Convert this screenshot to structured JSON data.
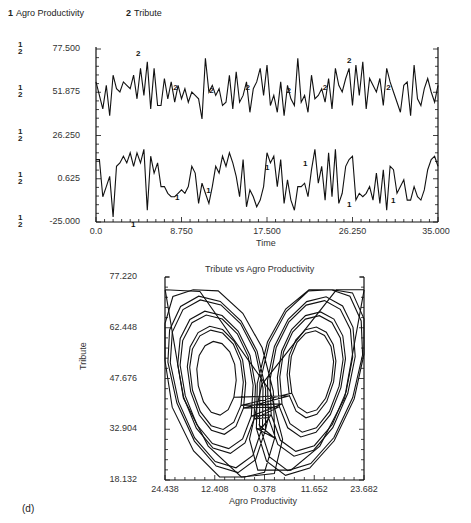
{
  "legend": {
    "items": [
      {
        "num": "1",
        "label": "Agro Productivity"
      },
      {
        "num": "2",
        "label": "Tribute"
      }
    ]
  },
  "panel_label": "(d)",
  "chart_data": [
    {
      "type": "line",
      "title": "",
      "xlabel": "Time",
      "ylabel": "",
      "xlim": [
        0.0,
        35.0
      ],
      "ylim": [
        -25.0,
        77.5
      ],
      "x_ticks": [
        "0.0",
        "8.750",
        "17.500",
        "26.250",
        "35.000"
      ],
      "y_ticks": [
        "77.500",
        "51.875",
        "26.250",
        "0.625",
        "-25.000"
      ],
      "y_tick_markers": "1 2",
      "legend_position": "top-left",
      "grid": false,
      "series": [
        {
          "name": "Agro Productivity",
          "marker": "1",
          "description": "Chaotic oscillation roughly between -20 and 20, centered near 0.6",
          "x": [
            0,
            0.35,
            0.7,
            1.05,
            1.4,
            1.75,
            2.1,
            2.45,
            2.8,
            3.15,
            3.5,
            3.85,
            4.2,
            4.55,
            4.9,
            5.25,
            5.6,
            5.95,
            6.3,
            6.65,
            7.0,
            7.35,
            7.7,
            8.05,
            8.4,
            8.75,
            9.1,
            9.45,
            9.8,
            10.15,
            10.5,
            10.85,
            11.2,
            11.55,
            11.9,
            12.25,
            12.6,
            12.95,
            13.3,
            13.65,
            14.0,
            14.35,
            14.7,
            15.05,
            15.4,
            15.75,
            16.1,
            16.45,
            16.8,
            17.15,
            17.5,
            17.85,
            18.2,
            18.55,
            18.9,
            19.25,
            19.6,
            19.95,
            20.3,
            20.65,
            21.0,
            21.35,
            21.7,
            22.05,
            22.4,
            22.75,
            23.1,
            23.45,
            23.8,
            24.15,
            24.5,
            24.85,
            25.2,
            25.55,
            25.9,
            26.25,
            26.6,
            26.95,
            27.3,
            27.65,
            28.0,
            28.35,
            28.7,
            29.05,
            29.4,
            29.75,
            30.1,
            30.45,
            30.8,
            31.15,
            31.5,
            31.85,
            32.2,
            32.55,
            32.9,
            33.25,
            33.6,
            33.95,
            34.3,
            34.65,
            35.0
          ],
          "values": [
            12,
            12,
            -10,
            -4,
            2,
            -22,
            8,
            10,
            14,
            10,
            16,
            8,
            16,
            10,
            18,
            -18,
            14,
            4,
            10,
            -4,
            -4,
            -8,
            -10,
            -10,
            -8,
            -6,
            -8,
            -4,
            8,
            4,
            -14,
            -2,
            -8,
            -14,
            -4,
            8,
            4,
            14,
            8,
            16,
            10,
            2,
            -10,
            12,
            -16,
            -6,
            -10,
            -16,
            -12,
            -4,
            16,
            10,
            14,
            -4,
            12,
            -14,
            0,
            -12,
            -18,
            -4,
            -4,
            -2,
            -10,
            6,
            18,
            -2,
            8,
            -12,
            16,
            -10,
            18,
            -14,
            -8,
            8,
            12,
            14,
            -12,
            -8,
            -10,
            -8,
            -4,
            -12,
            4,
            -14,
            6,
            -18,
            8,
            6,
            -8,
            -4,
            0,
            -12,
            -12,
            -4,
            -10,
            -12,
            -6,
            6,
            12,
            14,
            8
          ]
        },
        {
          "name": "Tribute",
          "marker": "2",
          "description": "Chaotic oscillation roughly between 30 and 75, centered near 50",
          "x": [
            0,
            0.35,
            0.7,
            1.05,
            1.4,
            1.75,
            2.1,
            2.45,
            2.8,
            3.15,
            3.5,
            3.85,
            4.2,
            4.55,
            4.9,
            5.25,
            5.6,
            5.95,
            6.3,
            6.65,
            7.0,
            7.35,
            7.7,
            8.05,
            8.4,
            8.75,
            9.1,
            9.45,
            9.8,
            10.15,
            10.5,
            10.85,
            11.2,
            11.55,
            11.9,
            12.25,
            12.6,
            12.95,
            13.3,
            13.65,
            14.0,
            14.35,
            14.7,
            15.05,
            15.4,
            15.75,
            16.1,
            16.45,
            16.8,
            17.15,
            17.5,
            17.85,
            18.2,
            18.55,
            18.9,
            19.25,
            19.6,
            19.95,
            20.3,
            20.65,
            21.0,
            21.35,
            21.7,
            22.05,
            22.4,
            22.75,
            23.1,
            23.45,
            23.8,
            24.15,
            24.5,
            24.85,
            25.2,
            25.55,
            25.9,
            26.25,
            26.6,
            26.95,
            27.3,
            27.65,
            28.0,
            28.35,
            28.7,
            29.05,
            29.4,
            29.75,
            30.1,
            30.45,
            30.8,
            31.15,
            31.5,
            31.85,
            32.2,
            32.55,
            32.9,
            33.25,
            33.6,
            33.95,
            34.3,
            34.65,
            35.0
          ],
          "values": [
            58,
            50,
            42,
            56,
            38,
            62,
            54,
            52,
            58,
            56,
            54,
            62,
            48,
            66,
            50,
            70,
            42,
            66,
            44,
            44,
            60,
            48,
            58,
            46,
            56,
            48,
            54,
            46,
            52,
            50,
            48,
            36,
            72,
            52,
            56,
            50,
            54,
            44,
            46,
            62,
            42,
            64,
            46,
            50,
            58,
            40,
            54,
            58,
            66,
            50,
            68,
            44,
            50,
            40,
            58,
            38,
            56,
            48,
            44,
            72,
            46,
            50,
            40,
            62,
            48,
            50,
            54,
            46,
            60,
            42,
            66,
            56,
            52,
            60,
            66,
            44,
            68,
            50,
            70,
            42,
            60,
            56,
            52,
            60,
            44,
            66,
            58,
            52,
            46,
            40,
            56,
            58,
            38,
            68,
            48,
            44,
            54,
            60,
            52,
            46,
            56
          ]
        }
      ]
    },
    {
      "type": "line",
      "title": "Tribute vs Agro Productivity",
      "xlabel": "Agro Productivity",
      "ylabel": "Tribute",
      "xlim": [
        -24.438,
        23.682
      ],
      "ylim": [
        18.132,
        77.22
      ],
      "x_ticks": [
        "24.438",
        "12.408",
        "0.378",
        "11.652",
        "23.682"
      ],
      "y_ticks": [
        "77.220",
        "62.448",
        "47.676",
        "32.904",
        "18.132"
      ],
      "grid": false,
      "description": "Phase-space trajectory forming a two-lobed butterfly (Lorenz-like strange attractor); left lobe centered near (-12, 49), right lobe near (11, 51); loops pass down to ~20 near x≈0",
      "series": [
        {
          "name": "Tribute vs Agro Productivity",
          "lobe_centers": [
            [
              -12.0,
              49.0
            ],
            [
              11.0,
              51.0
            ]
          ],
          "outer_extent": {
            "x": [
              -24.4,
              23.7
            ],
            "y": [
              19.0,
              73.5
            ]
          }
        }
      ]
    }
  ]
}
